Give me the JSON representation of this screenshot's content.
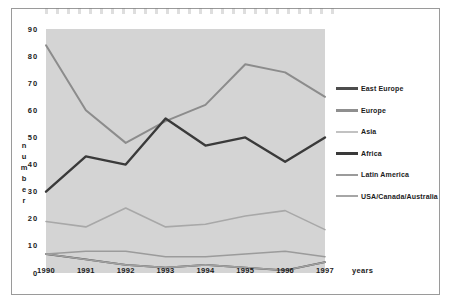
{
  "chart_data": {
    "type": "line",
    "title": "",
    "xlabel": "years",
    "ylabel": "number",
    "categories": [
      "1990",
      "1991",
      "1992",
      "1993",
      "1994",
      "1995",
      "1996",
      "1997"
    ],
    "x": [
      1990,
      1991,
      1992,
      1993,
      1994,
      1995,
      1996,
      1997
    ],
    "ylim": [
      0,
      90
    ],
    "yticks": [
      "0",
      "10",
      "20",
      "30",
      "40",
      "50",
      "60",
      "70",
      "80",
      "90"
    ],
    "ytick_values": [
      0,
      10,
      20,
      30,
      40,
      50,
      60,
      70,
      80,
      90
    ],
    "grid": false,
    "legend_position": "right",
    "plot_background": "#d4d4d4",
    "series": [
      {
        "name": "East Europe",
        "color": "#4d4d4d",
        "width": 1.8,
        "values": [
          7,
          5,
          3,
          2,
          3,
          2,
          1,
          4
        ]
      },
      {
        "name": "Europe",
        "color": "#8c8c8c",
        "width": 2.0,
        "values": [
          84,
          60,
          48,
          56,
          62,
          77,
          74,
          65
        ]
      },
      {
        "name": "Asia",
        "color": "#a8a8a8",
        "width": 1.6,
        "values": [
          19,
          17,
          24,
          17,
          18,
          21,
          23,
          16
        ]
      },
      {
        "name": "Africa",
        "color": "#3a3a3a",
        "width": 2.4,
        "values": [
          30,
          43,
          40,
          57,
          47,
          50,
          41,
          50
        ]
      },
      {
        "name": "Latin America",
        "color": "#9b9b9b",
        "width": 1.6,
        "values": [
          7,
          8,
          8,
          6,
          6,
          7,
          8,
          6
        ]
      },
      {
        "name": "USA/Canada/Australia",
        "color": "#a0a0a0",
        "width": 1.6,
        "values": [
          7,
          5,
          3,
          2,
          3,
          2,
          1,
          4
        ]
      }
    ]
  },
  "axes": {
    "y_label_letters": [
      "n",
      "u",
      "m",
      "b",
      "e",
      "r"
    ],
    "x_label": "years"
  },
  "legend": {
    "items": [
      {
        "label": "East Europe",
        "color": "#4d4d4d",
        "thickness": "3px"
      },
      {
        "label": "Europe",
        "color": "#8f8f8f",
        "thickness": "2.5px"
      },
      {
        "label": "Asia",
        "color": "#c2c2c2",
        "thickness": "2px"
      },
      {
        "label": "Africa",
        "color": "#3a3a3a",
        "thickness": "3.5px"
      },
      {
        "label": "Latin America",
        "color": "#9b9b9b",
        "thickness": "2px"
      },
      {
        "label": "USA/Canada/Australia",
        "color": "#a6a6a6",
        "thickness": "2px"
      }
    ]
  }
}
